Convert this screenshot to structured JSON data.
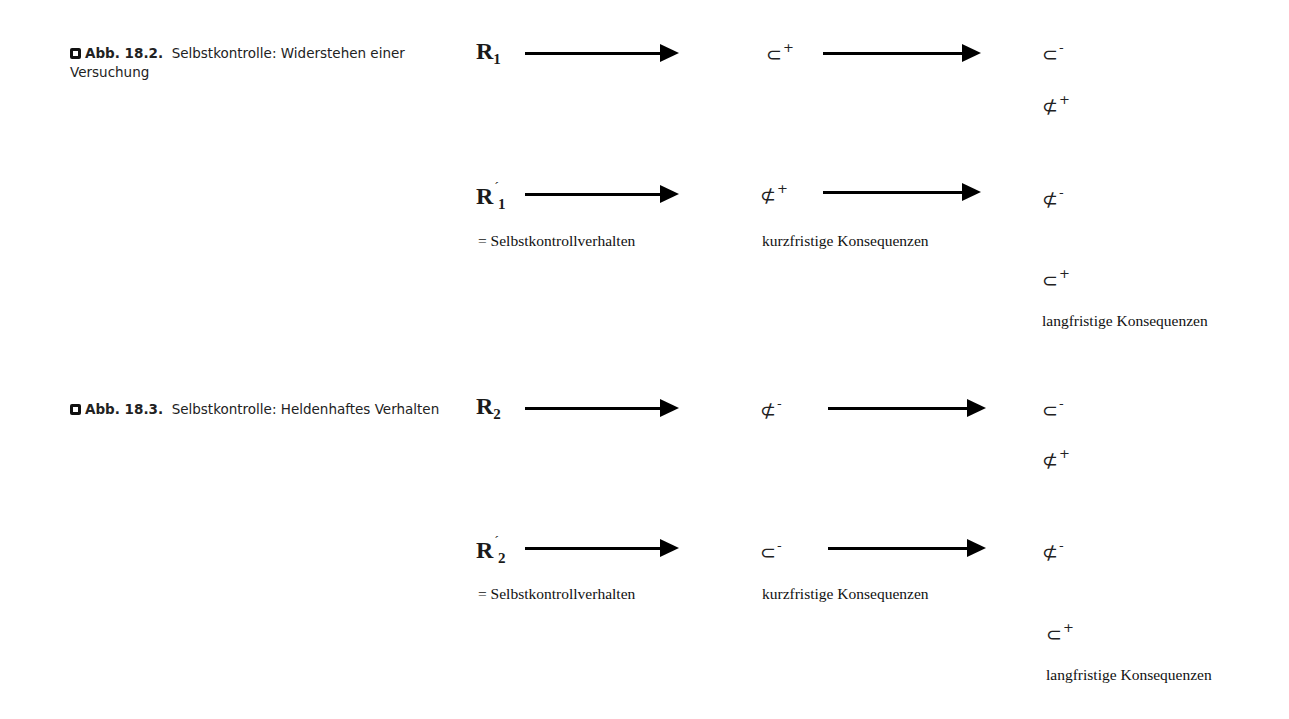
{
  "figures": [
    {
      "caption": {
        "number": "Abb. 18.2.",
        "text": "Selbstkontrolle: Widerstehen einer Versuchung"
      },
      "rows": [
        {
          "response": "R",
          "subscript": "1",
          "prime": "",
          "middle": "⊂",
          "middle_sign": "+",
          "right": [
            {
              "symbol": "⊂",
              "sign": "-"
            },
            {
              "symbol": "⊄",
              "sign": "+"
            }
          ]
        },
        {
          "response": "R",
          "subscript": "1",
          "prime": "´",
          "middle": "⊄",
          "middle_sign": "+",
          "right": [
            {
              "symbol": "⊄",
              "sign": "-"
            },
            {
              "symbol": "⊂",
              "sign": "+"
            }
          ],
          "response_note": "= Selbstkontrollverhalten",
          "middle_note": "kurzfristige Konsequenzen",
          "right_note": "langfristige Konsequenzen"
        }
      ]
    },
    {
      "caption": {
        "number": "Abb. 18.3.",
        "text": "Selbstkontrolle: Heldenhaftes Verhalten"
      },
      "rows": [
        {
          "response": "R",
          "subscript": "2",
          "prime": "",
          "middle": "⊄",
          "middle_sign": "-",
          "right": [
            {
              "symbol": "⊂",
              "sign": "-"
            },
            {
              "symbol": "⊄",
              "sign": "+"
            }
          ]
        },
        {
          "response": "R",
          "subscript": "2",
          "prime": "´",
          "middle": "⊂",
          "middle_sign": "-",
          "right": [
            {
              "symbol": "⊄",
              "sign": "-"
            },
            {
              "symbol": "⊂",
              "sign": "+"
            }
          ],
          "response_note": "= Selbstkontrollverhalten",
          "middle_note": "kurzfristige Konsequenzen",
          "right_note": "langfristige Konsequenzen"
        }
      ]
    }
  ]
}
